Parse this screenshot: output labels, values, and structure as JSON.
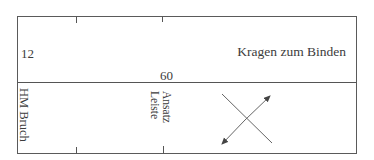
{
  "diagram": {
    "upper_section": {
      "left_label": "12",
      "bottom_label": "60",
      "right_label": "Kragen zum Binden"
    },
    "lower_section": {
      "left_rotated_label": "HM Bruch",
      "middle_rotated_label_line1": "Ansatz",
      "middle_rotated_label_line2": "Leiste",
      "symbol": "crossed-double-arrow"
    },
    "colors": {
      "line": "#555555",
      "text": "#3c3c3c",
      "background": "#ffffff"
    }
  }
}
